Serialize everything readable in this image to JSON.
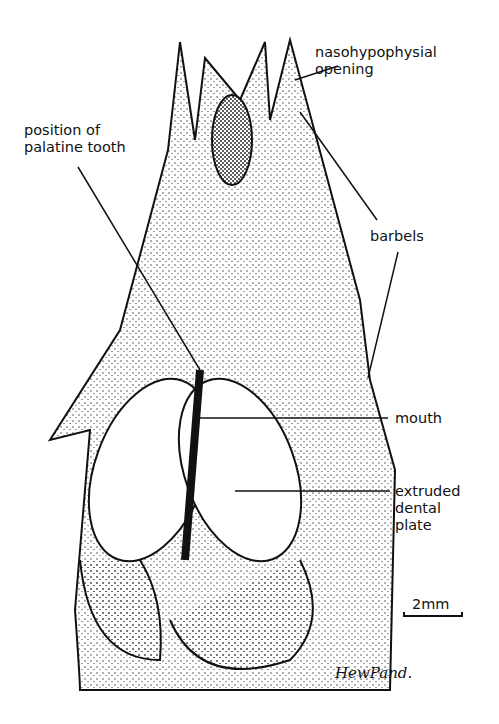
{
  "labels": {
    "nasohypophysial": "nasohypophysial\nopening",
    "palatine": "position of\npalatine tooth",
    "barbels": "barbels",
    "mouth": "mouth",
    "dental_plate": "extruded\ndental\nplate"
  },
  "scale_bar": "2mm",
  "signature": "HewPand."
}
